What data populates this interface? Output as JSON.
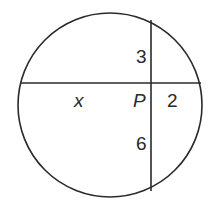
{
  "diagram": {
    "type": "circle-intersecting-chords",
    "stroke_color": "#2a2a2a",
    "circle": {
      "cx": 110,
      "cy": 105,
      "r": 92
    },
    "chords": [
      {
        "name": "horizontal-chord",
        "x1": 21,
        "y1": 83,
        "x2": 200,
        "y2": 83
      },
      {
        "name": "vertical-chord",
        "x1": 151,
        "y1": 21,
        "x2": 151,
        "y2": 190
      }
    ],
    "intersection": {
      "label": "P",
      "x": 151,
      "y": 83
    },
    "labels": {
      "segment_top": "3",
      "segment_bottom": "6",
      "segment_left": "x",
      "segment_right": "2",
      "point": "P"
    }
  }
}
